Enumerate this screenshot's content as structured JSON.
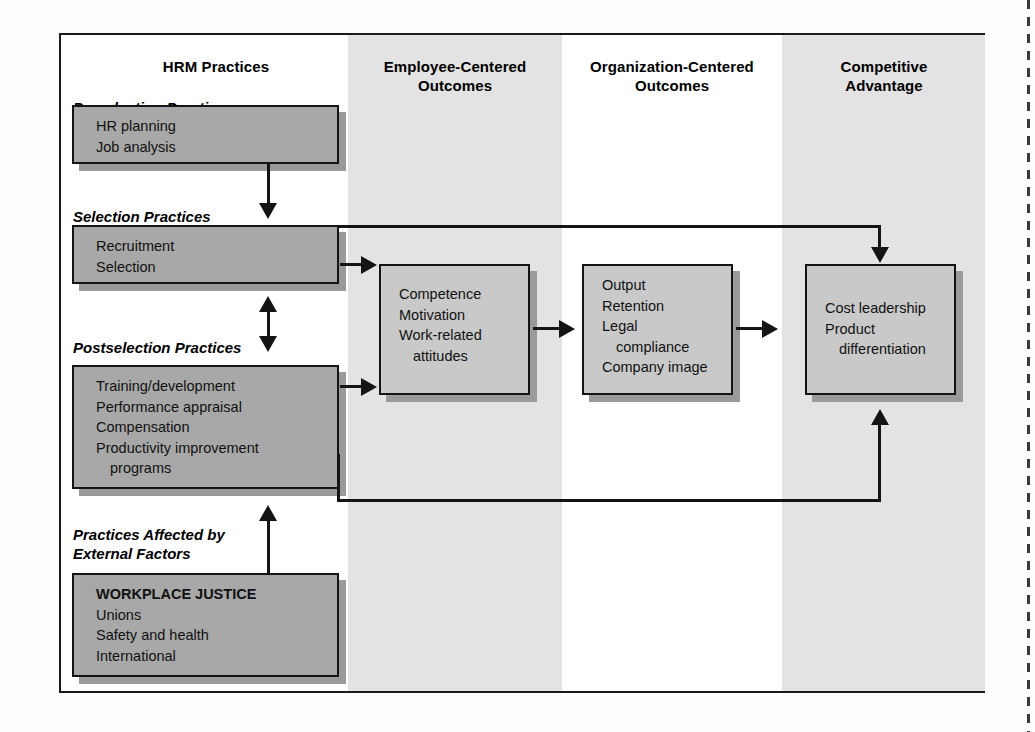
{
  "figure": {
    "columns": [
      {
        "id": "hrm",
        "label": "HRM Practices"
      },
      {
        "id": "employee",
        "label": "Employee-Centered\nOutcomes",
        "line1": "Employee-Centered",
        "line2": "Outcomes"
      },
      {
        "id": "organization",
        "label": "Organization-Centered\nOutcomes",
        "line1": "Organization-Centered",
        "line2": "Outcomes"
      },
      {
        "id": "competitive",
        "label": "Competitive\nAdvantage",
        "line1": "Competitive",
        "line2": "Advantage"
      }
    ],
    "sections": [
      {
        "id": "preselection",
        "caption": "Preselection Practices"
      },
      {
        "id": "selection",
        "caption": "Selection Practices"
      },
      {
        "id": "postselection",
        "caption": "Postselection Practices"
      },
      {
        "id": "external",
        "caption_line1": "Practices Affected by",
        "caption_line2": "External Factors"
      }
    ],
    "boxes": [
      {
        "id": "preselection-box",
        "column": "hrm",
        "items": [
          "HR planning",
          "Job analysis"
        ]
      },
      {
        "id": "selection-box",
        "column": "hrm",
        "items": [
          "Recruitment",
          "Selection"
        ]
      },
      {
        "id": "postselection-box",
        "column": "hrm",
        "items": [
          "Training/development",
          "Performance appraisal",
          "Compensation",
          "Productivity improvement",
          "programs"
        ]
      },
      {
        "id": "external-box",
        "column": "hrm",
        "heading": "WORKPLACE JUSTICE",
        "items": [
          "Unions",
          "Safety and health",
          "International"
        ]
      },
      {
        "id": "employee-outcomes-box",
        "column": "employee",
        "items": [
          "Competence",
          "Motivation",
          "Work-related",
          "attitudes"
        ]
      },
      {
        "id": "organization-outcomes-box",
        "column": "organization",
        "items": [
          "Output",
          "Retention",
          "Legal",
          "compliance",
          "Company image"
        ]
      },
      {
        "id": "competitive-advantage-box",
        "column": "competitive",
        "items": [
          "Cost leadership",
          "Product",
          "differentiation"
        ]
      }
    ],
    "connectors": [
      {
        "id": "preselection-to-selection",
        "from": "preselection-box",
        "to": "selection-box",
        "type": "arrow-down"
      },
      {
        "id": "selection-to-employee",
        "from": "selection-box",
        "to": "employee-outcomes-box",
        "type": "arrow-right"
      },
      {
        "id": "selection-postselection-both",
        "from": "selection-box",
        "to": "postselection-box",
        "type": "double-arrow-vertical"
      },
      {
        "id": "postselection-to-employee",
        "from": "postselection-box",
        "to": "employee-outcomes-box",
        "type": "arrow-right"
      },
      {
        "id": "employee-to-organization",
        "from": "employee-outcomes-box",
        "to": "organization-outcomes-box",
        "type": "arrow-right"
      },
      {
        "id": "organization-to-competitive",
        "from": "organization-outcomes-box",
        "to": "competitive-advantage-box",
        "type": "arrow-right"
      },
      {
        "id": "selection-to-competitive",
        "from": "selection-box",
        "to": "competitive-advantage-box",
        "type": "elbow-top-arrow-down"
      },
      {
        "id": "postselection-to-competitive",
        "from": "postselection-box",
        "to": "competitive-advantage-box",
        "type": "elbow-bottom-arrow-up"
      },
      {
        "id": "external-to-postselection",
        "from": "external-box",
        "to": "postselection-box",
        "type": "arrow-up"
      }
    ],
    "colors": {
      "band": "#e3e3e3",
      "box_dark": "#a8a8a8",
      "box_light": "#c9c9c9",
      "stroke": "#141414",
      "shadow": "#9a9a9a",
      "page": "#ffffff"
    }
  }
}
